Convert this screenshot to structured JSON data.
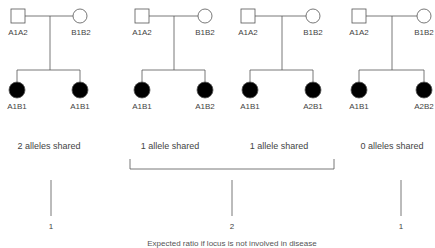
{
  "families": [
    {
      "father": "A1A2",
      "mother": "B1B2",
      "child1": "A1B1",
      "child2": "A1B1",
      "caption": "2 alleles shared"
    },
    {
      "father": "A1A2",
      "mother": "B1B2",
      "child1": "A1B1",
      "child2": "A1B2",
      "caption": "1 allele shared"
    },
    {
      "father": "A1A2",
      "mother": "B1B2",
      "child1": "A1B1",
      "child2": "A2B1",
      "caption": "1 allele shared"
    },
    {
      "father": "A1A2",
      "mother": "B1B2",
      "child1": "A1B1",
      "child2": "A2B2",
      "caption": "0 alleles shared"
    }
  ],
  "ratios": [
    "1",
    "2",
    "1"
  ],
  "footer": "Expected ratio if locus is not involved in disease"
}
